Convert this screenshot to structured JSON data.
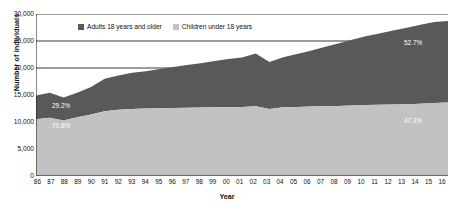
{
  "chart_data": {
    "type": "area",
    "stacked": true,
    "title": "",
    "subtitle": "",
    "xlabel": "Year",
    "ylabel": "Number of individuals",
    "ylim": [
      0,
      30000
    ],
    "yticks": [
      0,
      5000,
      10000,
      15000,
      20000,
      25000,
      30000
    ],
    "ytick_labels": [
      "0",
      "5,000",
      "10,000",
      "15,000",
      "20,000",
      "25,000",
      "30,000"
    ],
    "grid": "horizontal-partial",
    "legend_position": "top-center-inside",
    "categories": [
      "86",
      "87",
      "88",
      "89",
      "90",
      "91",
      "92",
      "93",
      "94",
      "95",
      "96",
      "97",
      "98",
      "99",
      "00",
      "01",
      "02",
      "03",
      "04",
      "05",
      "06",
      "07",
      "08",
      "09",
      "10",
      "11",
      "12",
      "13",
      "14",
      "15",
      "16"
    ],
    "series": [
      {
        "name": "Children under 18 years",
        "color": "#c2c2c2",
        "values": [
          10500,
          10800,
          10300,
          10900,
          11400,
          12000,
          12250,
          12400,
          12500,
          12550,
          12600,
          12650,
          12700,
          12720,
          12750,
          12800,
          12900,
          12400,
          12750,
          12800,
          12850,
          12900,
          12950,
          13050,
          13150,
          13200,
          13250,
          13300,
          13400,
          13500,
          13600
        ]
      },
      {
        "name": "Adults 18 years and older",
        "color": "#595959",
        "values": [
          4400,
          4600,
          4250,
          4500,
          5100,
          6000,
          6350,
          6700,
          6900,
          7250,
          7600,
          7900,
          8200,
          8580,
          8900,
          9150,
          9800,
          8700,
          9250,
          9800,
          10350,
          11000,
          11600,
          12200,
          12750,
          13200,
          13700,
          14150,
          14600,
          15000,
          15100
        ]
      }
    ],
    "totals": [
      14900,
      15400,
      14550,
      15400,
      16500,
      18000,
      18600,
      19100,
      19400,
      19800,
      20200,
      20550,
      20900,
      21300,
      21650,
      21950,
      22700,
      21100,
      22000,
      22600,
      23200,
      23900,
      24550,
      25250,
      25900,
      26400,
      26950,
      27450,
      28000,
      28500,
      28700
    ],
    "annotations": [
      {
        "name": "adults-pct-left",
        "text": "29.2%",
        "series": "Adults 18 years and older",
        "x": "86"
      },
      {
        "name": "children-pct-left",
        "text": "70.8%",
        "series": "Children under 18 years",
        "x": "86"
      },
      {
        "name": "adults-pct-right",
        "text": "52.7%",
        "series": "Adults 18 years and older",
        "x": "16"
      },
      {
        "name": "children-pct-right",
        "text": "47.3%",
        "series": "Children under 18 years",
        "x": "16"
      }
    ]
  },
  "axes": {
    "y_title": "Number of individuals",
    "x_title": "Year"
  },
  "legend": {
    "items": [
      {
        "label": "Adults 18 years and older",
        "color": "#595959"
      },
      {
        "label": "Children under 18 years",
        "color": "#c2c2c2"
      }
    ]
  },
  "colors": {
    "adults": "#595959",
    "children": "#c2c2c2",
    "axis": "#111111",
    "gridline": "#3a3a3a",
    "background": "#ffffff",
    "annotation_text": "#ffffff"
  }
}
